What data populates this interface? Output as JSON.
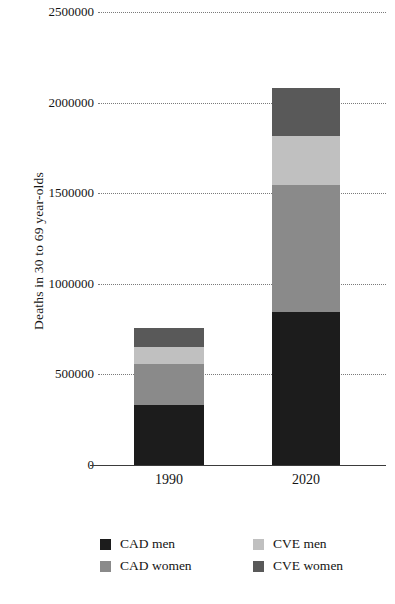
{
  "chart_data": {
    "type": "bar",
    "subtype": "stacked-bar",
    "title": "",
    "xlabel": "",
    "ylabel": "Deaths in 30 to 69 year-olds",
    "categories": [
      "1990",
      "2020"
    ],
    "ylim": [
      0,
      2500000
    ],
    "yticks": [
      0,
      500000,
      1000000,
      1500000,
      2000000,
      2500000
    ],
    "ytick_labels": [
      "0",
      "500000",
      "1000000",
      "1500000",
      "2000000",
      "2500000"
    ],
    "grid": "horizontal-dotted",
    "legend_position": "bottom",
    "series": [
      {
        "name": "CAD men",
        "color": "#1c1c1c",
        "values": [
          330000,
          845000
        ]
      },
      {
        "name": "CAD women",
        "color": "#8a8a8a",
        "values": [
          230000,
          700000
        ]
      },
      {
        "name": "CVE men",
        "color": "#c0c0c0",
        "values": [
          90000,
          270000
        ]
      },
      {
        "name": "CVE women",
        "color": "#595959",
        "values": [
          105000,
          265000
        ]
      }
    ],
    "totals": [
      755000,
      2080000
    ]
  },
  "legend": {
    "items": [
      {
        "label": "CAD men",
        "color": "#1c1c1c"
      },
      {
        "label": "CAD women",
        "color": "#8a8a8a"
      },
      {
        "label": "CVE men",
        "color": "#c0c0c0"
      },
      {
        "label": "CVE women",
        "color": "#595959"
      }
    ]
  }
}
